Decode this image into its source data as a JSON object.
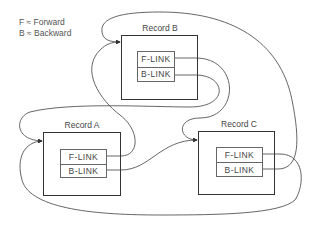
{
  "legend": {
    "forward": "F ≈ Forward",
    "backward": "B ≈ Backward"
  },
  "records": [
    {
      "id": "A",
      "title": "Record A",
      "f_link": "F-LINK",
      "b_link": "B-LINK"
    },
    {
      "id": "B",
      "title": "Record B",
      "f_link": "F-LINK",
      "b_link": "B-LINK"
    },
    {
      "id": "C",
      "title": "Record C",
      "f_link": "F-LINK",
      "b_link": "B-LINK"
    }
  ],
  "colors": {
    "line": "#555555",
    "box_border": "#333333",
    "text": "#444444"
  }
}
